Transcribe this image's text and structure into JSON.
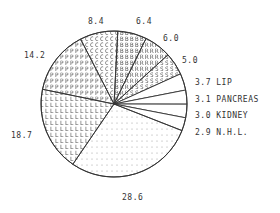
{
  "chart_data": {
    "type": "pie",
    "title": "",
    "start_angle_deg": 3,
    "direction": "clockwise",
    "center": [
      114,
      104
    ],
    "radius": 73,
    "slices": [
      {
        "label": "",
        "value": 6.4,
        "display": "6.4",
        "fill": "B",
        "label_pos": [
          136,
          17
        ]
      },
      {
        "label": "",
        "value": 6.0,
        "display": "6.0",
        "fill": "R",
        "label_pos": [
          163,
          34
        ]
      },
      {
        "label": "",
        "value": 5.0,
        "display": "5.0",
        "fill": "S",
        "label_pos": [
          182,
          56
        ]
      },
      {
        "label": "LIP",
        "value": 3.7,
        "display": "3.7 LIP",
        "fill": "none",
        "label_pos": [
          195,
          78
        ]
      },
      {
        "label": "PANCREAS",
        "value": 3.1,
        "display": "3.1 PANCREAS",
        "fill": "none",
        "label_pos": [
          195,
          95
        ]
      },
      {
        "label": "KIDNEY",
        "value": 3.0,
        "display": "3.0 KIDNEY",
        "fill": "none",
        "label_pos": [
          195,
          111
        ]
      },
      {
        "label": "N.H.L.",
        "value": 2.9,
        "display": "2.9 N.H.L.",
        "fill": "none",
        "label_pos": [
          195,
          128
        ]
      },
      {
        "label": "",
        "value": 28.6,
        "display": "28.6",
        "fill": "dots",
        "label_pos": [
          122,
          193
        ]
      },
      {
        "label": "",
        "value": 18.7,
        "display": "18.7",
        "fill": "L",
        "label_pos": [
          11,
          131
        ]
      },
      {
        "label": "",
        "value": 14.2,
        "display": "14.2",
        "fill": "P",
        "label_pos": [
          24,
          51
        ]
      },
      {
        "label": "",
        "value": 8.4,
        "display": "8.4",
        "fill": "C",
        "label_pos": [
          88,
          17
        ]
      }
    ],
    "categories": [
      "6.4",
      "6.0",
      "5.0",
      "LIP",
      "PANCREAS",
      "KIDNEY",
      "N.H.L.",
      "28.6",
      "18.7",
      "14.2",
      "8.4"
    ],
    "values": [
      6.4,
      6.0,
      5.0,
      3.7,
      3.1,
      3.0,
      2.9,
      28.6,
      18.7,
      14.2,
      8.4
    ],
    "legend": "none",
    "colors": {
      "line": "#333333",
      "fill_text": "#555555",
      "background": "#ffffff"
    }
  }
}
